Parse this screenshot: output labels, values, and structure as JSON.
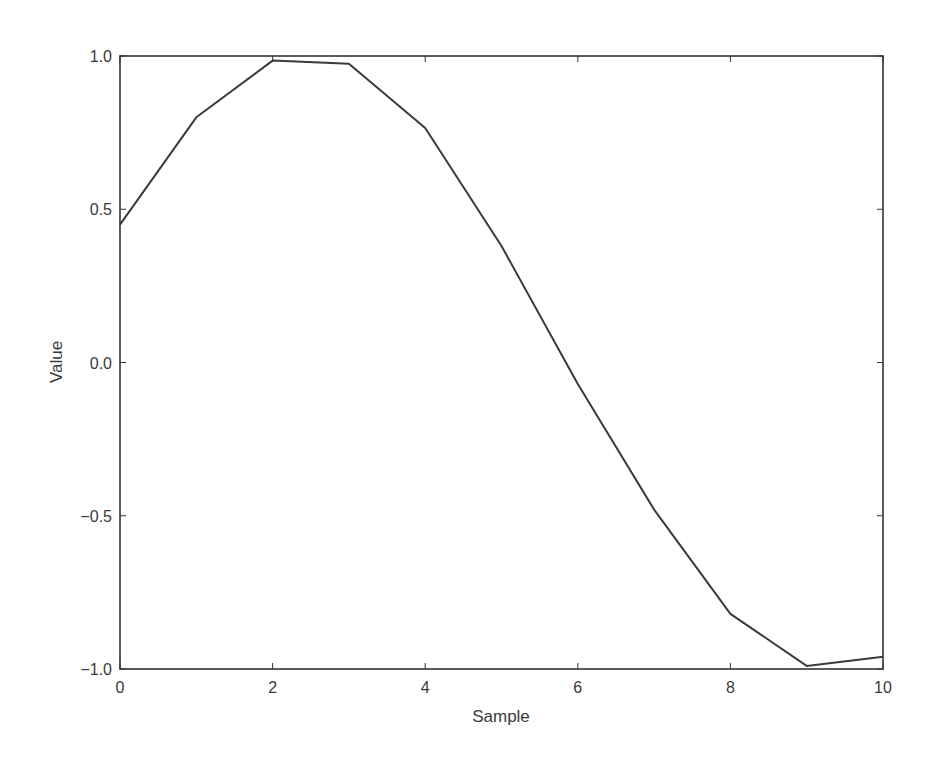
{
  "chart_data": {
    "type": "line",
    "title": "",
    "xlabel": "Sample",
    "ylabel": "Value",
    "xlim": [
      0,
      10
    ],
    "ylim": [
      -1.0,
      1.0
    ],
    "grid": false,
    "legend": null,
    "x_ticks": [
      0,
      2,
      4,
      6,
      8,
      10
    ],
    "x_tick_labels": [
      "0",
      "2",
      "4",
      "6",
      "8",
      "10"
    ],
    "y_ticks": [
      1.0,
      0.5,
      0.0,
      -0.5,
      -1.0
    ],
    "y_tick_labels": [
      "1.0",
      "0.5",
      "0.0",
      "−0.5",
      "−1.0"
    ],
    "series": [
      {
        "name": "value",
        "color": "#3a3a3a",
        "x": [
          0,
          1,
          2,
          3,
          4,
          5,
          6,
          7,
          8,
          9,
          10
        ],
        "values": [
          0.45,
          0.8,
          0.985,
          0.975,
          0.765,
          0.38,
          -0.07,
          -0.48,
          -0.82,
          -0.99,
          -0.96
        ]
      }
    ]
  },
  "colors": {
    "line": "#3a3a3a",
    "axes": "#333333",
    "background": "#ffffff"
  }
}
